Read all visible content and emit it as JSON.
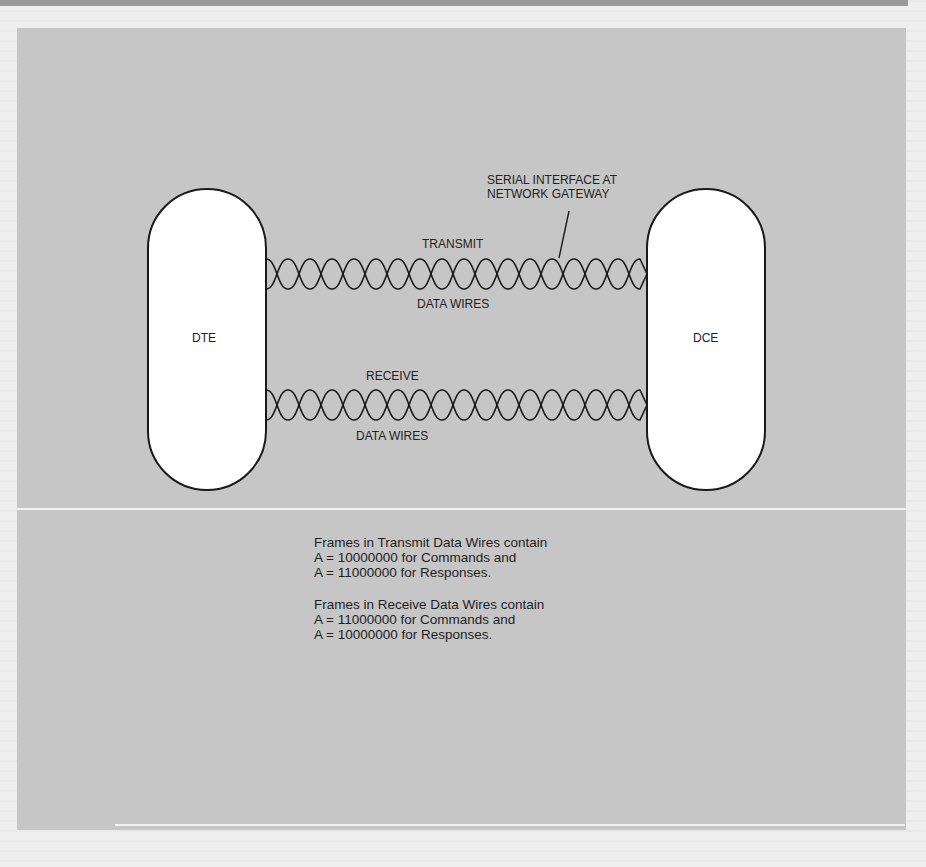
{
  "diagram": {
    "devices": {
      "left": {
        "label": "DTE"
      },
      "right": {
        "label": "DCE"
      }
    },
    "interface_callout": {
      "line1": "SERIAL INTERFACE AT",
      "line2": "NETWORK GATEWAY"
    },
    "transmit_pair": {
      "top_label": "TRANSMIT",
      "bottom_label": "DATA WIRES"
    },
    "receive_pair": {
      "top_label": "RECEIVE",
      "bottom_label": "DATA WIRES"
    }
  },
  "notes": {
    "transmit": {
      "line1": "Frames in Transmit Data Wires contain",
      "line2": "A = 10000000 for Commands and",
      "line3": "A = 11000000 for Responses."
    },
    "receive": {
      "line1": "Frames in Receive Data Wires contain",
      "line2": "A = 11000000 for Commands and",
      "line3": "A = 10000000 for Responses."
    }
  },
  "colors": {
    "panel": "#c6c6c6",
    "device_fill": "#ffffff",
    "stroke": "#1a1a1a"
  }
}
